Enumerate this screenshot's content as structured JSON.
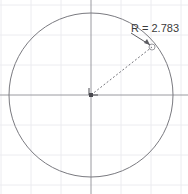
{
  "canvas": {
    "width": 188,
    "height": 194,
    "background_color": "#ffffff"
  },
  "grid": {
    "visible": true,
    "spacing_px": 30,
    "line_color": "#ececf0",
    "origin_x": 91,
    "origin_y": 95
  },
  "axes": {
    "visible": true,
    "line_color": "#8d8d93",
    "x_axis_y": 95,
    "y_axis_x": 91
  },
  "circle": {
    "center_x": 91,
    "center_y": 95,
    "radius_px": 82,
    "stroke_color": "#7a7a80",
    "stroke_width": 1,
    "fill": "none"
  },
  "center_marker": {
    "x": 91,
    "y": 95,
    "color": "#4a4a50",
    "size": 4
  },
  "radius_handle": {
    "x": 152,
    "y": 47,
    "radius_px": 3,
    "stroke_color": "#9a9aa0"
  },
  "radius_line": {
    "from_x": 91,
    "from_y": 95,
    "to_x": 152,
    "to_y": 47,
    "style": "dashed",
    "dash_pattern": "2,2",
    "stroke_color": "#77777d"
  },
  "dimension": {
    "label": "R = 2.783",
    "value": 2.783,
    "symbol": "R",
    "text_x": 131,
    "text_y": 32,
    "text_color": "#3a3a3a",
    "leader_from_x": 152,
    "leader_from_y": 47,
    "leader_to_x": 131,
    "leader_to_y": 34,
    "arrow_color": "#555559"
  }
}
